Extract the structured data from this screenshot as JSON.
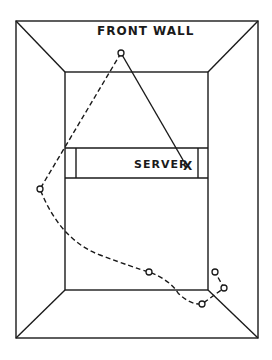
{
  "diagram": {
    "title_label": "FRONT WALL",
    "server_label": "SERVER",
    "server_mark": "X",
    "colors": {
      "line": "#1a1a1a",
      "background": "#ffffff"
    },
    "elements": {
      "outer_frame": [
        16,
        21,
        258,
        338
      ],
      "back_wall_rect": [
        65,
        72,
        208,
        290
      ],
      "service_box": {
        "y_top": 148,
        "y_bottom": 178,
        "left_line_x": 76,
        "right_line_x": 198
      },
      "serve_ball_start": [
        121,
        53
      ],
      "server_position": [
        186,
        167
      ],
      "bounce_points": [
        [
          121,
          53
        ],
        [
          40,
          189
        ],
        [
          149,
          272
        ],
        [
          202,
          304
        ],
        [
          224,
          288
        ],
        [
          215,
          272
        ]
      ]
    }
  }
}
